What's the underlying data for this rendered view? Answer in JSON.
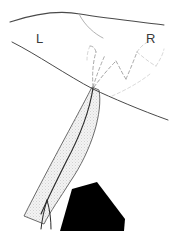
{
  "figure": {
    "kind": "anatomical-line-diagram",
    "width": 171,
    "height": 231,
    "background_color": "#ffffff",
    "labels": {
      "left_side": "L",
      "right_side": "R"
    },
    "colors": {
      "outline_stroke": "#4a4a4a",
      "fine_outline_stroke": "#6e6e6e",
      "dashed_branch_stroke": "#8e8e8e",
      "dashed_branch_faint_stroke": "#b4b4b4",
      "band_fill": "#ededed",
      "band_outline": "#5a5a5a",
      "core_line": "#2a2a2a",
      "solid_wedge_fill": "#000000",
      "label_color": "#3a3a3a"
    },
    "label_positions": {
      "left_label_x": 36,
      "left_label_y": 43,
      "right_label_x": 146,
      "right_label_y": 43
    },
    "elements": {
      "top_arc": {
        "name": "upper boundary arc",
        "path": "M 10 22 C 40 12 64 11 80 14 C 104 18 140 22 164 25"
      },
      "apex_descending_curve": {
        "name": "secondary curve descending from apex",
        "path": "M 79 14 C 85 26 95 34 103 38"
      },
      "left_oblique_curve": {
        "name": "left oblique boundary",
        "path": "M 12 42 C 36 54 68 76 93 89"
      },
      "right_sweeping_curve": {
        "name": "right sweeping boundary",
        "path": "M 93 89 C 112 98 140 110 168 120"
      },
      "band": {
        "name": "shaded tapering band",
        "outline_path": "M 92 87 L 99 90 C 103 112 92 150 70 182 C 60 198 50 212 44 224 L 24 216 C 34 196 52 162 66 136 C 80 110 88 95 92 87 Z"
      },
      "band_core_line": {
        "name": "central dark line within band",
        "path": "M 93 88 C 90 108 80 136 66 162 C 56 182 47 200 41 214"
      },
      "band_core_bifurcation": {
        "name": "distal bifurcation of central line",
        "path_a": "M 47 200 C 44 210 42 220 41 229",
        "path_b": "M 47 200 C 50 210 51 220 51 229"
      },
      "solid_wedge": {
        "name": "solid black wedge",
        "path": "M 72 189 L 97 182 L 125 219 L 124 231 L 60 231 Z"
      }
    },
    "dashed_branches": [
      {
        "id": "branch-left-upper",
        "path": "M 93 87 C 92 74 93 62 96 52",
        "opacity": 0.75
      },
      {
        "id": "branch-left-hook",
        "path": "M 96 52 C 95 48 93 46 90 46",
        "opacity": 0.7
      },
      {
        "id": "branch-left-mid",
        "path": "M 93 87 C 97 74 101 64 105 55",
        "opacity": 0.75
      },
      {
        "id": "branch-center-v",
        "path": "M 94 87 C 102 76 110 67 116 61",
        "opacity": 0.8
      },
      {
        "id": "branch-center-dip",
        "path": "M 116 61 C 120 68 123 75 126 79",
        "opacity": 0.8
      },
      {
        "id": "branch-center-rise",
        "path": "M 126 79 C 130 70 134 60 137 52",
        "opacity": 0.75
      },
      {
        "id": "branch-right-upper",
        "path": "M 137 52 C 141 46 146 42 151 41",
        "opacity": 0.6
      },
      {
        "id": "branch-right-arc",
        "path": "M 137 52 C 143 57 150 63 156 66",
        "opacity": 0.55
      },
      {
        "id": "branch-right-tail",
        "path": "M 156 66 C 160 60 163 54 164 49",
        "opacity": 0.5
      },
      {
        "id": "branch-right-low",
        "path": "M 112 96 C 126 90 140 82 150 74",
        "opacity": 0.5
      },
      {
        "id": "branch-left-tip",
        "path": "M 90 46 C 88 50 87 55 87 60",
        "opacity": 0.55
      }
    ]
  }
}
